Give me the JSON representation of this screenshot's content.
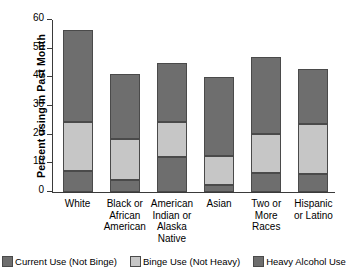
{
  "chart_data": {
    "type": "bar",
    "subtype": "stacked",
    "title": "",
    "xlabel": "",
    "ylabel": "Percent using in Past Month",
    "ylim": [
      0,
      60
    ],
    "yticks": [
      0,
      10,
      20,
      30,
      40,
      50,
      60
    ],
    "grid": false,
    "legend_position": "bottom",
    "categories": [
      "White",
      "Black or African American",
      "American Indian or Alaska Native",
      "Asian",
      "Two or More Races",
      "Hispanic or Latino"
    ],
    "category_lines": [
      [
        "White"
      ],
      [
        "Black or",
        "African",
        "American"
      ],
      [
        "American",
        "Indian or",
        "Alaska",
        "Native"
      ],
      [
        "Asian"
      ],
      [
        "Two or",
        "More",
        "Races"
      ],
      [
        "Hispanic",
        "or Latino"
      ]
    ],
    "series": [
      {
        "name": "Heavy Alcohol Use",
        "color": "#6e6e6e",
        "values": [
          7.5,
          4.3,
          12.1,
          2.5,
          6.8,
          6.4
        ]
      },
      {
        "name": "Binge Use (Not Heavy)",
        "color": "#c6c6c6",
        "values": [
          17.0,
          14.3,
          12.4,
          10.0,
          13.4,
          17.2
        ]
      },
      {
        "name": "Current Use (Not Binge)",
        "color": "#6e6e6e",
        "values": [
          32.0,
          22.6,
          20.5,
          27.5,
          26.8,
          19.4
        ]
      }
    ],
    "totals": [
      56.5,
      41.2,
      45.0,
      40.0,
      47.0,
      43.0
    ],
    "segment_tops": {
      "heavy_top": [
        7.5,
        4.3,
        12.1,
        2.5,
        6.8,
        6.4
      ],
      "binge_top": [
        24.5,
        18.6,
        24.5,
        12.5,
        20.2,
        23.6
      ],
      "bar_top": [
        56.5,
        41.2,
        45.0,
        40.0,
        47.0,
        43.0
      ]
    }
  },
  "axis": {
    "y_title": "Percent using in Past Month",
    "y_tick_labels": [
      "60",
      "50",
      "40",
      "30",
      "20",
      "10",
      "0"
    ]
  },
  "legend": {
    "items": [
      {
        "label": "Current Use (Not Binge)",
        "color": "#6e6e6e",
        "swatch_name": "legend-swatch-current-use"
      },
      {
        "label": "Binge Use (Not Heavy)",
        "color": "#c6c6c6",
        "swatch_name": "legend-swatch-binge-use"
      },
      {
        "label": "Heavy Alcohol Use",
        "color": "#6e6e6e",
        "swatch_name": "legend-swatch-heavy-alcohol-use"
      }
    ]
  }
}
